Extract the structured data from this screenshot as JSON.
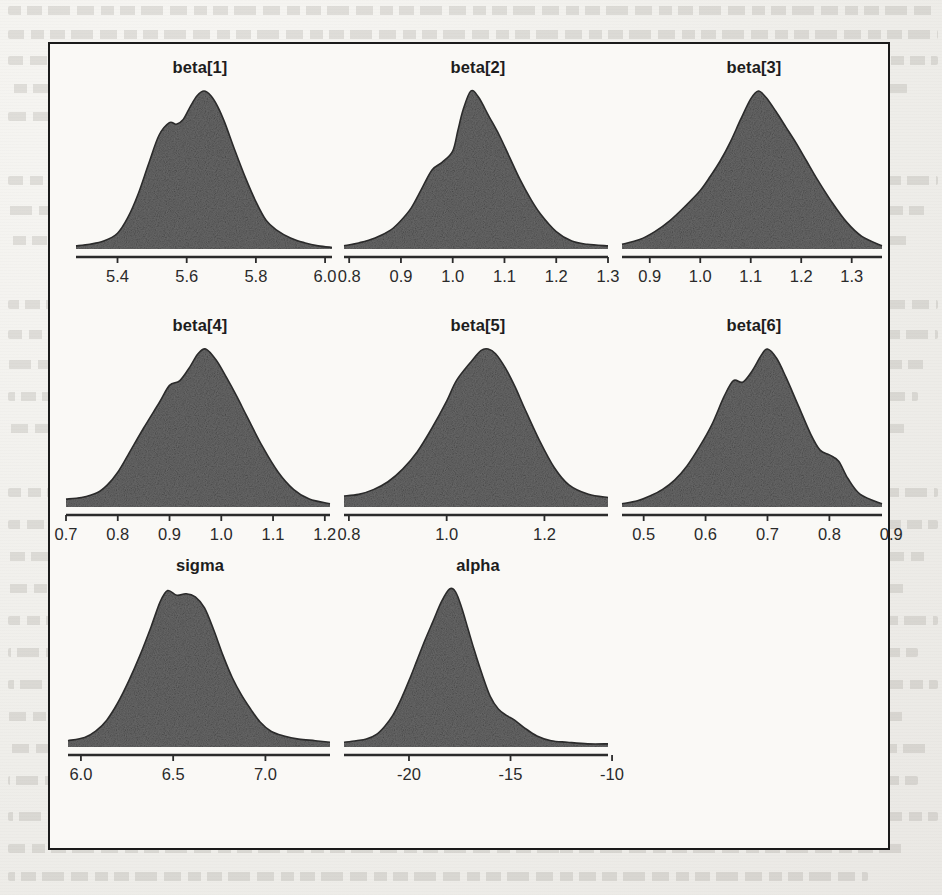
{
  "figure": {
    "kind": "posterior-density-panel-grid",
    "frame_color": "#1b1b1b",
    "fill_color": "#6a6a6a",
    "line_color": "#2b2b2b",
    "background_color": "#faf9f6",
    "columns": 3,
    "rows": 3
  },
  "chart_data": [
    {
      "type": "area",
      "title": "beta[1]",
      "xlabel": "",
      "ylabel": "",
      "xlim": [
        5.28,
        6.02
      ],
      "ylim": [
        0,
        1
      ],
      "grid": false,
      "legend": "none",
      "ticks": [
        5.4,
        5.6,
        5.8,
        6.0
      ],
      "ticklabels": [
        "5.4",
        "5.6",
        "5.8",
        "6.0"
      ],
      "x": [
        5.28,
        5.32,
        5.36,
        5.4,
        5.43,
        5.46,
        5.49,
        5.52,
        5.55,
        5.57,
        5.59,
        5.61,
        5.63,
        5.65,
        5.67,
        5.69,
        5.71,
        5.74,
        5.77,
        5.8,
        5.83,
        5.86,
        5.9,
        5.94,
        5.98,
        6.02
      ],
      "y": [
        0.02,
        0.03,
        0.05,
        0.1,
        0.2,
        0.35,
        0.54,
        0.72,
        0.8,
        0.79,
        0.82,
        0.9,
        0.97,
        1.0,
        0.97,
        0.9,
        0.8,
        0.62,
        0.45,
        0.3,
        0.18,
        0.12,
        0.07,
        0.04,
        0.02,
        0.01
      ]
    },
    {
      "type": "area",
      "title": "beta[2]",
      "xlabel": "",
      "ylabel": "",
      "xlim": [
        0.79,
        1.3
      ],
      "ylim": [
        0,
        1
      ],
      "grid": false,
      "legend": "none",
      "ticks": [
        0.8,
        0.9,
        1.0,
        1.1,
        1.2,
        1.3
      ],
      "ticklabels": [
        "0.8",
        "0.9",
        "1.0",
        "1.1",
        "1.2",
        "1.3"
      ],
      "x": [
        0.79,
        0.82,
        0.85,
        0.88,
        0.9,
        0.92,
        0.94,
        0.96,
        0.98,
        1.0,
        1.01,
        1.02,
        1.035,
        1.05,
        1.07,
        1.09,
        1.11,
        1.13,
        1.15,
        1.17,
        1.2,
        1.23,
        1.26,
        1.3
      ],
      "y": [
        0.02,
        0.04,
        0.07,
        0.12,
        0.18,
        0.26,
        0.38,
        0.5,
        0.55,
        0.62,
        0.75,
        0.88,
        1.0,
        0.96,
        0.84,
        0.72,
        0.58,
        0.44,
        0.32,
        0.22,
        0.11,
        0.05,
        0.03,
        0.02
      ]
    },
    {
      "type": "area",
      "title": "beta[3]",
      "xlabel": "",
      "ylabel": "",
      "xlim": [
        0.845,
        1.36
      ],
      "ylim": [
        0,
        1
      ],
      "grid": false,
      "legend": "none",
      "ticks": [
        0.9,
        1.0,
        1.1,
        1.2,
        1.3
      ],
      "ticklabels": [
        "0.9",
        "1.0",
        "1.1",
        "1.2",
        "1.3"
      ],
      "x": [
        0.845,
        0.88,
        0.91,
        0.94,
        0.97,
        1.0,
        1.02,
        1.04,
        1.06,
        1.08,
        1.1,
        1.115,
        1.13,
        1.15,
        1.17,
        1.19,
        1.21,
        1.23,
        1.26,
        1.29,
        1.32,
        1.36
      ],
      "y": [
        0.03,
        0.06,
        0.11,
        0.18,
        0.27,
        0.37,
        0.46,
        0.56,
        0.68,
        0.82,
        0.95,
        1.0,
        0.96,
        0.87,
        0.77,
        0.67,
        0.56,
        0.45,
        0.3,
        0.17,
        0.08,
        0.02
      ]
    },
    {
      "type": "area",
      "title": "beta[4]",
      "xlabel": "",
      "ylabel": "",
      "xlim": [
        0.7,
        1.21
      ],
      "ylim": [
        0,
        1
      ],
      "grid": false,
      "legend": "none",
      "ticks": [
        0.7,
        0.8,
        0.9,
        1.0,
        1.1,
        1.2
      ],
      "ticklabels": [
        "0.7",
        "0.8",
        "0.9",
        "1.0",
        "1.1",
        "1.2"
      ],
      "x": [
        0.7,
        0.73,
        0.76,
        0.78,
        0.8,
        0.82,
        0.85,
        0.88,
        0.9,
        0.92,
        0.94,
        0.955,
        0.97,
        0.99,
        1.01,
        1.03,
        1.05,
        1.08,
        1.11,
        1.14,
        1.17,
        1.21
      ],
      "y": [
        0.05,
        0.06,
        0.09,
        0.14,
        0.22,
        0.33,
        0.5,
        0.66,
        0.77,
        0.8,
        0.89,
        0.97,
        1.0,
        0.93,
        0.82,
        0.7,
        0.57,
        0.38,
        0.22,
        0.11,
        0.05,
        0.02
      ]
    },
    {
      "type": "area",
      "title": "beta[5]",
      "xlabel": "",
      "ylabel": "",
      "xlim": [
        0.79,
        1.33
      ],
      "ylim": [
        0,
        1
      ],
      "grid": false,
      "legend": "none",
      "ticks": [
        0.8,
        1.0,
        1.2
      ],
      "ticklabels": [
        "0.8",
        "1.0",
        "1.2"
      ],
      "x": [
        0.79,
        0.82,
        0.85,
        0.88,
        0.91,
        0.94,
        0.97,
        1.0,
        1.02,
        1.05,
        1.07,
        1.085,
        1.1,
        1.12,
        1.14,
        1.16,
        1.19,
        1.22,
        1.25,
        1.29,
        1.33
      ],
      "y": [
        0.07,
        0.08,
        0.11,
        0.16,
        0.24,
        0.35,
        0.5,
        0.67,
        0.8,
        0.92,
        0.99,
        1.0,
        0.97,
        0.88,
        0.76,
        0.62,
        0.42,
        0.25,
        0.14,
        0.08,
        0.06
      ]
    },
    {
      "type": "area",
      "title": "beta[6]",
      "xlabel": "",
      "ylabel": "",
      "xlim": [
        0.465,
        0.885
      ],
      "ylim": [
        0,
        1
      ],
      "grid": false,
      "legend": "none",
      "ticks": [
        0.5,
        0.6,
        0.7,
        0.8,
        0.9
      ],
      "ticklabels": [
        "0.5",
        "0.6",
        "0.7",
        "0.8",
        "0.9"
      ],
      "x": [
        0.465,
        0.49,
        0.51,
        0.53,
        0.55,
        0.57,
        0.59,
        0.61,
        0.63,
        0.645,
        0.66,
        0.675,
        0.69,
        0.7,
        0.715,
        0.73,
        0.75,
        0.77,
        0.785,
        0.8,
        0.815,
        0.83,
        0.85,
        0.885
      ],
      "y": [
        0.02,
        0.04,
        0.07,
        0.11,
        0.17,
        0.26,
        0.38,
        0.52,
        0.7,
        0.8,
        0.79,
        0.86,
        0.96,
        1.0,
        0.94,
        0.82,
        0.64,
        0.46,
        0.36,
        0.33,
        0.29,
        0.18,
        0.08,
        0.02
      ]
    },
    {
      "type": "area",
      "title": "sigma",
      "xlabel": "",
      "ylabel": "",
      "xlim": [
        5.93,
        7.35
      ],
      "ylim": [
        0,
        1
      ],
      "grid": false,
      "legend": "none",
      "ticks": [
        6.0,
        6.5,
        7.0
      ],
      "ticklabels": [
        "6.0",
        "6.5",
        "7.0"
      ],
      "x": [
        5.93,
        6.02,
        6.08,
        6.14,
        6.2,
        6.26,
        6.32,
        6.38,
        6.43,
        6.47,
        6.52,
        6.57,
        6.62,
        6.67,
        6.72,
        6.77,
        6.82,
        6.87,
        6.92,
        6.97,
        7.03,
        7.1,
        7.18,
        7.27,
        7.35
      ],
      "y": [
        0.04,
        0.06,
        0.1,
        0.17,
        0.28,
        0.42,
        0.58,
        0.76,
        0.92,
        0.99,
        0.96,
        0.97,
        0.95,
        0.88,
        0.74,
        0.58,
        0.44,
        0.33,
        0.24,
        0.16,
        0.1,
        0.07,
        0.05,
        0.04,
        0.03
      ]
    },
    {
      "type": "area",
      "title": "alpha",
      "xlabel": "",
      "ylabel": "",
      "xlim": [
        -23.2,
        -10.2
      ],
      "ylim": [
        0,
        1
      ],
      "grid": false,
      "legend": "none",
      "ticks": [
        -20,
        -15,
        -10
      ],
      "ticklabels": [
        "-20",
        "-15",
        "-10"
      ],
      "x": [
        -23.2,
        -22.6,
        -22.1,
        -21.6,
        -21.2,
        -20.8,
        -20.4,
        -20.0,
        -19.6,
        -19.2,
        -18.8,
        -18.4,
        -18.0,
        -17.7,
        -17.4,
        -17.1,
        -16.8,
        -16.4,
        -16.0,
        -15.6,
        -15.2,
        -14.8,
        -14.3,
        -13.7,
        -13.0,
        -12.2,
        -11.2,
        -10.2
      ],
      "y": [
        0.03,
        0.04,
        0.05,
        0.08,
        0.13,
        0.2,
        0.3,
        0.42,
        0.55,
        0.68,
        0.8,
        0.92,
        1.0,
        0.98,
        0.88,
        0.75,
        0.62,
        0.46,
        0.32,
        0.24,
        0.2,
        0.17,
        0.12,
        0.07,
        0.04,
        0.03,
        0.02,
        0.02
      ]
    }
  ]
}
